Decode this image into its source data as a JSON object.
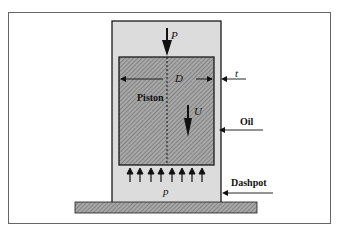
{
  "figure": {
    "labels": {
      "force": "P",
      "diameter": "D",
      "gap": "t",
      "piston": "Piston",
      "velocity": "U",
      "oil": "Oil",
      "pressure": "p",
      "dashpot": "Dashpot"
    },
    "pressure_arrow_count": 8,
    "colors": {
      "cylinder_fill": "#dcdcdc",
      "piston_fill": "#9a9a9a",
      "stroke": "#1a1a1a",
      "frame": "#555555",
      "background": "#ffffff"
    }
  }
}
